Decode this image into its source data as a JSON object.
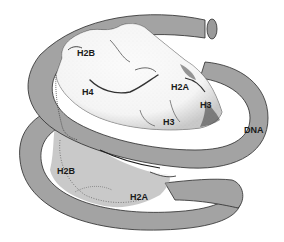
{
  "diagram": {
    "colors": {
      "dna": "#a3a3a3",
      "dna_stroke": "#2a2a2a",
      "histone_core": "#f7f7f7",
      "histone_shade": "#2f2f2f",
      "background": "#ffffff"
    },
    "labels": [
      {
        "id": "h2b-top",
        "text": "H2B",
        "x": 77,
        "y": 49
      },
      {
        "id": "h4",
        "text": "H4",
        "x": 82,
        "y": 88
      },
      {
        "id": "h2a-top",
        "text": "H2A",
        "x": 171,
        "y": 83
      },
      {
        "id": "h3-right",
        "text": "H3",
        "x": 200,
        "y": 101
      },
      {
        "id": "h3-center",
        "text": "H3",
        "x": 163,
        "y": 118
      },
      {
        "id": "dna",
        "text": "DNA",
        "x": 244,
        "y": 126
      },
      {
        "id": "h2b-bottom",
        "text": "H2B",
        "x": 57,
        "y": 167
      },
      {
        "id": "h2a-bottom",
        "text": "H2A",
        "x": 130,
        "y": 193
      }
    ]
  }
}
